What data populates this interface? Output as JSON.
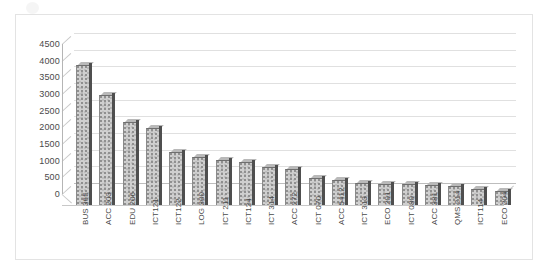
{
  "chart_data": {
    "type": "bar",
    "title": "",
    "subtitle": "",
    "xlabel": "",
    "ylabel": "",
    "ylim": [
      0,
      4500
    ],
    "ytick_step": 500,
    "grid": true,
    "legend": false,
    "style": "3d-column",
    "yticks": [
      "4500",
      "4000",
      "3500",
      "3000",
      "2500",
      "2000",
      "1500",
      "1000",
      "500",
      "0"
    ],
    "categories": [
      "BUS 365",
      "ACC 203",
      "EDU 206",
      "ICT121",
      "ICT122",
      "LOG 300",
      "ICT 211",
      "ICT124",
      "ICT 314",
      "ACC 272",
      "ICT 070",
      "ACC 5412",
      "ICT 313",
      "ECO 201",
      "ICT 080",
      "ACC 381",
      "QMS 214",
      "ICT114",
      "ECO 204"
    ],
    "values": [
      4200,
      3300,
      2500,
      2300,
      1600,
      1450,
      1350,
      1300,
      1150,
      1080,
      820,
      750,
      670,
      640,
      620,
      600,
      560,
      470,
      430
    ]
  },
  "colors": {
    "bar_fill": "#cfcfcf",
    "bar_side": "#4f4f4f",
    "gridline": "#e0e0e0",
    "axis": "#b5b5b5",
    "frame": "#e3e3e3",
    "text": "#4a4a4a",
    "background": "#ffffff"
  }
}
